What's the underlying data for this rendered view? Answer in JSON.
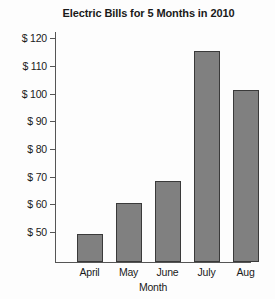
{
  "chart_data": {
    "type": "bar",
    "title": "Electric Bills for 5 Months in 2010",
    "xlabel": "Month",
    "ylabel": "",
    "categories": [
      "April",
      "May",
      "June",
      "July",
      "Aug"
    ],
    "values": [
      49,
      60,
      68,
      115,
      101
    ],
    "ytick_labels": [
      "$ 120",
      "$ 110",
      "$ 100",
      "$ 90",
      "$ 80",
      "$ 70",
      "$ 60",
      "$ 50"
    ],
    "ytick_values": [
      120,
      110,
      100,
      90,
      80,
      70,
      60,
      50
    ],
    "ylim": [
      38.7,
      123
    ],
    "axis_baseline_value": 38.7,
    "grid": false,
    "legend": "none",
    "bar_color": "#808080",
    "bar_border_color": "#3a3a3a",
    "axis_color": "#555555",
    "background_color": "#fdfdfd"
  }
}
